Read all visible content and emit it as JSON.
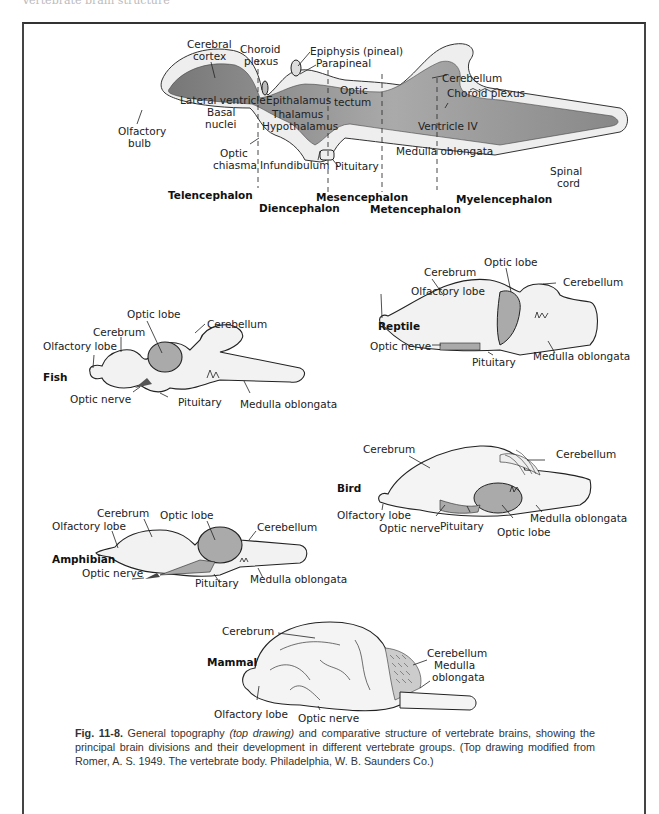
{
  "page": {
    "running_head": "Vertebrate brain structure"
  },
  "top_drawing": {
    "labels": {
      "cerebral_cortex_1": "Cerebral",
      "cerebral_cortex_2": "cortex",
      "choroid_plexus_1_a": "Choroid",
      "choroid_plexus_1_b": "plexus",
      "epiphysis": "Epiphysis (pineal)",
      "parapineal": "Parapineal",
      "cerebellum": "Cerebellum",
      "choroid_plexus_2": "Choroid plexus",
      "optic_tectum_1": "Optic",
      "optic_tectum_2": "tectum",
      "lateral_ventricle": "Lateral ventricle",
      "epithalamus": "Epithalamus",
      "basal_nuclei_1": "Basal",
      "basal_nuclei_2": "nuclei",
      "thalamus": "Thalamus",
      "hypothalamus": "Hypothalamus",
      "ventricle_iv": "Ventricle IV",
      "olfactory_bulb_1": "Olfactory",
      "olfactory_bulb_2": "bulb",
      "optic_chiasma_1": "Optic",
      "optic_chiasma_2": "chiasma",
      "infundibulum": "Infundibulum",
      "pituitary": "Pituitary",
      "medulla_oblongata": "Medulla oblongata",
      "spinal_cord_1": "Spinal",
      "spinal_cord_2": "cord"
    },
    "divisions": {
      "telencephalon": "Telencephalon",
      "diencephalon": "Diencephalon",
      "mesencephalon": "Mesencephalon",
      "metencephalon": "Metencephalon",
      "myelencephalon": "Myelencephalon"
    }
  },
  "fish": {
    "title": "Fish",
    "labels": {
      "optic_lobe": "Optic lobe",
      "cerebrum": "Cerebrum",
      "cerebellum": "Cerebellum",
      "olfactory_lobe": "Olfactory lobe",
      "optic_nerve": "Optic nerve",
      "pituitary": "Pituitary",
      "medulla_oblongata": "Medulla oblongata"
    }
  },
  "reptile": {
    "title": "Reptile",
    "labels": {
      "optic_lobe": "Optic lobe",
      "cerebrum": "Cerebrum",
      "cerebellum": "Cerebellum",
      "olfactory_lobe": "Olfactory lobe",
      "optic_nerve": "Optic nerve",
      "pituitary": "Pituitary",
      "medulla_oblongata": "Medulla oblongata"
    }
  },
  "bird": {
    "title": "Bird",
    "labels": {
      "cerebrum": "Cerebrum",
      "cerebellum": "Cerebellum",
      "olfactory_lobe": "Olfactory lobe",
      "optic_nerve": "Optic nerve",
      "pituitary": "Pituitary",
      "medulla_oblongata": "Medulla oblongata",
      "optic_lobe": "Optic lobe"
    }
  },
  "amphibian": {
    "title": "Amphibian",
    "labels": {
      "cerebrum": "Cerebrum",
      "optic_lobe": "Optic lobe",
      "olfactory_lobe": "Olfactory lobe",
      "cerebellum": "Cerebellum",
      "optic_nerve": "Optic nerve",
      "pituitary": "Pituitary",
      "medulla_oblongata": "Medulla oblongata"
    }
  },
  "mammal": {
    "title": "Mammal",
    "labels": {
      "cerebrum": "Cerebrum",
      "cerebellum": "Cerebellum",
      "medulla_1": "Medulla",
      "medulla_2": "oblongata",
      "olfactory_lobe": "Olfactory lobe",
      "optic_nerve": "Optic nerve"
    }
  },
  "caption": {
    "fig_number": "Fig. 11-8.",
    "part1": " General topography ",
    "italic": "(top drawing)",
    "part2": " and comparative structure of vertebrate brains, showing the principal brain divisions and their development in different vertebrate groups. (Top drawing modified from Romer, A. S. 1949. The vertebrate body. Philadelphia, W. B. Saunders Co.)"
  }
}
